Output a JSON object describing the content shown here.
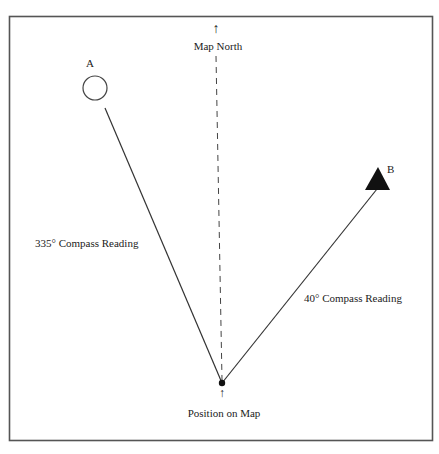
{
  "diagram": {
    "north_arrow": "↑",
    "north_label": "Map North",
    "position_arrow": "↑",
    "position_label": "Position on Map",
    "landmark_a": {
      "label": "A",
      "shape": "circle",
      "bearing": "335°",
      "bearing_label": "335° Compass Reading"
    },
    "landmark_b": {
      "label": "B",
      "shape": "filled-triangle",
      "bearing": "40°",
      "bearing_label": "40° Compass Reading"
    },
    "colors": {
      "line": "#333333",
      "frame": "#555555",
      "fill": "#111111",
      "background": "#ffffff"
    }
  }
}
